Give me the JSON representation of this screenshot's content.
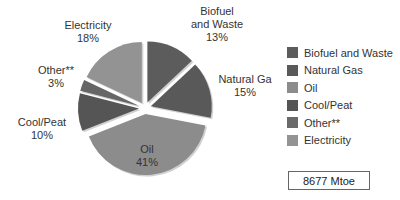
{
  "chart_data": {
    "type": "pie",
    "title": "",
    "exploded": true,
    "start_angle": "12 o'clock, clockwise",
    "slices": [
      {
        "label": "Biofuel and Waste",
        "display_label": "Biofuel\nand Waste",
        "value": 13,
        "pct_label": "13%",
        "color": "#5c5c5c"
      },
      {
        "label": "Natural Gas",
        "display_label": "Natural Ga",
        "value": 15,
        "pct_label": "15%",
        "color": "#595959"
      },
      {
        "label": "Oil",
        "display_label": "Oil",
        "value": 41,
        "pct_label": "41%",
        "color": "#8c8c8c"
      },
      {
        "label": "Cool/Peat",
        "display_label": "Cool/Peat",
        "value": 10,
        "pct_label": "10%",
        "color": "#555555"
      },
      {
        "label": "Other**",
        "display_label": "Other**",
        "value": 3,
        "pct_label": "3%",
        "color": "#666666"
      },
      {
        "label": "Electricity",
        "display_label": "Electricity",
        "value": 18,
        "pct_label": "18%",
        "color": "#939393"
      }
    ],
    "legend": {
      "position": "right",
      "entries": [
        "Biofuel and Waste",
        "Natural Gas",
        "Oil",
        "Cool/Peat",
        "Other**",
        "Electricity"
      ]
    },
    "annotation": "8677 Mtoe"
  },
  "labels": {
    "biofuel": {
      "line1": "Biofuel",
      "line2": "and Waste",
      "pct": "13%"
    },
    "natural_gas": {
      "line1": "Natural Ga",
      "pct": "15%"
    },
    "oil": {
      "line1": "Oil",
      "pct": "41%"
    },
    "coal_peat": {
      "line1": "Cool/Peat",
      "pct": "10%"
    },
    "other": {
      "line1": "Other**",
      "pct": "3%"
    },
    "electricity": {
      "line1": "Electricity",
      "pct": "18%"
    }
  },
  "legend": {
    "items": [
      {
        "label": "Biofuel and Waste",
        "color": "#5c5c5c"
      },
      {
        "label": "Natural Gas",
        "color": "#595959"
      },
      {
        "label": "Oil",
        "color": "#8c8c8c"
      },
      {
        "label": "Cool/Peat",
        "color": "#555555"
      },
      {
        "label": "Other**",
        "color": "#6a6a6a"
      },
      {
        "label": "Electricity",
        "color": "#939393"
      }
    ]
  },
  "total": {
    "label": "8677 Mtoe"
  }
}
